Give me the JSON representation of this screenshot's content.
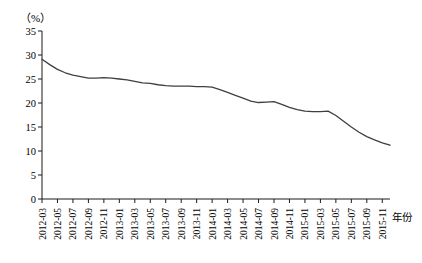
{
  "chart_data": {
    "type": "line",
    "title": "",
    "subtitle": "",
    "xlabel": "年份",
    "ylabel": "（%）",
    "ylim": [
      0,
      35
    ],
    "ytick_values": [
      0,
      5,
      10,
      15,
      20,
      25,
      30,
      35
    ],
    "ytick_labels": [
      "0",
      "5",
      "10",
      "15",
      "20",
      "25",
      "30",
      "35"
    ],
    "grid": false,
    "legend": null,
    "line_color": "#3f3f3f",
    "axis_color": "#1a1a1a",
    "categories": [
      "2012-03",
      "2012-04",
      "2012-05",
      "2012-06",
      "2012-07",
      "2012-08",
      "2012-09",
      "2012-10",
      "2012-11",
      "2012-12",
      "2013-01",
      "2013-02",
      "2013-03",
      "2013-04",
      "2013-05",
      "2013-06",
      "2013-07",
      "2013-08",
      "2013-09",
      "2013-10",
      "2013-11",
      "2013-12",
      "2014-01",
      "2014-02",
      "2014-03",
      "2014-04",
      "2014-05",
      "2014-06",
      "2014-07",
      "2014-08",
      "2014-09",
      "2014-10",
      "2014-11",
      "2014-12",
      "2015-01",
      "2015-02",
      "2015-03",
      "2015-04",
      "2015-05",
      "2015-06",
      "2015-07",
      "2015-08",
      "2015-09",
      "2015-10",
      "2015-11",
      "2015-12"
    ],
    "xtick_labels": [
      "2012-03",
      "2012-05",
      "2012-07",
      "2012-09",
      "2012-11",
      "2013-01",
      "2013-03",
      "2013-05",
      "2013-07",
      "2013-09",
      "2013-11",
      "2014-01",
      "2014-03",
      "2014-05",
      "2014-07",
      "2014-09",
      "2014-11",
      "2015-01",
      "2015-03",
      "2015-05",
      "2015-07",
      "2015-09",
      "2015-11"
    ],
    "values": [
      29.1,
      28.0,
      27.0,
      26.3,
      25.8,
      25.5,
      25.2,
      25.2,
      25.3,
      25.2,
      25.0,
      24.8,
      24.5,
      24.2,
      24.1,
      23.8,
      23.6,
      23.5,
      23.5,
      23.5,
      23.4,
      23.4,
      23.3,
      22.8,
      22.2,
      21.6,
      21.0,
      20.4,
      20.1,
      20.2,
      20.3,
      19.7,
      19.1,
      18.6,
      18.3,
      18.2,
      18.2,
      18.3,
      17.4,
      16.2,
      15.0,
      13.9,
      13.0,
      12.3,
      11.7,
      11.2
    ],
    "values_tail": {
      "note": "series continues flat at ~10.2 to the right edge"
    }
  }
}
